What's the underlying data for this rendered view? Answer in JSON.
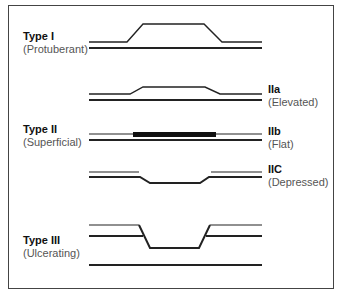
{
  "diagram": {
    "colors": {
      "line": "#222222",
      "border": "#444444",
      "subtitle": "#555555"
    },
    "labels": [
      {
        "id": "type1",
        "title": "Type I",
        "subtitle": "(Protuberant)",
        "side": "left"
      },
      {
        "id": "type2a",
        "title": "IIa",
        "subtitle": "(Elevated)",
        "side": "right"
      },
      {
        "id": "type2",
        "title": "Type II",
        "subtitle": "(Superficial)",
        "side": "left"
      },
      {
        "id": "type2b",
        "title": "IIb",
        "subtitle": "(Flat)",
        "side": "right"
      },
      {
        "id": "type2c",
        "title": "IIC",
        "subtitle": "(Depressed)",
        "side": "right"
      },
      {
        "id": "type3",
        "title": "Type III",
        "subtitle": "(Ulcerating)",
        "side": "left"
      }
    ]
  }
}
